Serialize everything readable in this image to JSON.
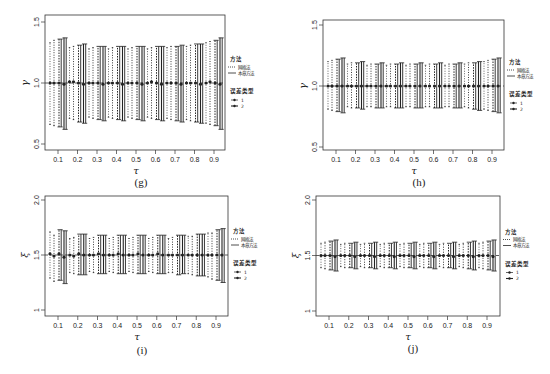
{
  "figure": {
    "legend": {
      "method_title": "方法",
      "methods": [
        {
          "label": "网格法",
          "style": "dotted"
        },
        {
          "label": "本章方法",
          "style": "solid"
        }
      ],
      "error_type_title": "误差类型",
      "error_types": [
        {
          "label": "1"
        },
        {
          "label": "2"
        }
      ]
    },
    "colors": {
      "ink": "#222222",
      "axis": "#333333",
      "reference_line": "#333333"
    }
  },
  "chart_data": [
    {
      "panel": "(g)",
      "type": "errorbar",
      "title": "",
      "xlabel": "τ",
      "ylabel": "γ",
      "ylim": [
        0.5,
        1.5
      ],
      "yticks": [
        "0.5",
        "1.0",
        "1.5"
      ],
      "categories": [
        "0.1",
        "0.2",
        "0.3",
        "0.4",
        "0.5",
        "0.6",
        "0.7",
        "0.8",
        "0.9"
      ],
      "reference_line": 1.0,
      "grid": false,
      "legend_position": "right",
      "series": [
        {
          "name": "网格法 / 误差类型1",
          "center": [
            1.0,
            1.01,
            1.0,
            1.0,
            1.0,
            1.0,
            1.0,
            1.0,
            1.0
          ],
          "lower": [
            0.66,
            0.71,
            0.72,
            0.72,
            0.72,
            0.72,
            0.71,
            0.7,
            0.67
          ],
          "upper": [
            1.33,
            1.29,
            1.28,
            1.28,
            1.28,
            1.28,
            1.29,
            1.3,
            1.33
          ]
        },
        {
          "name": "网格法 / 误差类型2",
          "center": [
            1.0,
            1.01,
            1.0,
            1.0,
            1.0,
            1.01,
            1.0,
            1.0,
            1.01
          ],
          "lower": [
            0.65,
            0.7,
            0.71,
            0.71,
            0.71,
            0.71,
            0.7,
            0.69,
            0.66
          ],
          "upper": [
            1.35,
            1.3,
            1.29,
            1.29,
            1.29,
            1.29,
            1.3,
            1.31,
            1.34
          ]
        },
        {
          "name": "本章方法 / 误差类型1",
          "center": [
            1.0,
            1.0,
            1.0,
            1.0,
            1.0,
            1.0,
            1.0,
            1.0,
            1.0
          ],
          "lower": [
            0.64,
            0.68,
            0.7,
            0.7,
            0.7,
            0.7,
            0.69,
            0.68,
            0.65
          ],
          "upper": [
            1.36,
            1.31,
            1.3,
            1.3,
            1.3,
            1.3,
            1.3,
            1.32,
            1.35
          ]
        },
        {
          "name": "本章方法 / 误差类型2",
          "center": [
            0.99,
            0.99,
            0.99,
            0.99,
            0.99,
            0.99,
            0.99,
            0.99,
            0.99
          ],
          "lower": [
            0.62,
            0.67,
            0.69,
            0.69,
            0.69,
            0.69,
            0.68,
            0.67,
            0.62
          ],
          "upper": [
            1.37,
            1.32,
            1.3,
            1.3,
            1.3,
            1.3,
            1.31,
            1.32,
            1.37
          ]
        }
      ]
    },
    {
      "panel": "(h)",
      "type": "errorbar",
      "title": "",
      "xlabel": "τ",
      "ylabel": "γ",
      "ylim": [
        0.5,
        1.5
      ],
      "yticks": [
        "0.5",
        "1.0",
        "1.5"
      ],
      "categories": [
        "0.1",
        "0.2",
        "0.3",
        "0.4",
        "0.5",
        "0.6",
        "0.7",
        "0.8",
        "0.9"
      ],
      "reference_line": 1.0,
      "grid": false,
      "legend_position": "right",
      "series": [
        {
          "name": "网格法 / 误差类型1",
          "center": [
            1.0,
            1.0,
            1.0,
            1.0,
            1.0,
            1.0,
            1.0,
            1.0,
            1.0
          ],
          "lower": [
            0.81,
            0.83,
            0.83,
            0.83,
            0.83,
            0.83,
            0.83,
            0.83,
            0.81
          ],
          "upper": [
            1.2,
            1.18,
            1.17,
            1.17,
            1.17,
            1.17,
            1.17,
            1.18,
            1.2
          ]
        },
        {
          "name": "网格法 / 误差类型2",
          "center": [
            1.0,
            1.0,
            1.0,
            1.0,
            1.0,
            1.0,
            1.0,
            1.0,
            1.0
          ],
          "lower": [
            0.8,
            0.82,
            0.83,
            0.83,
            0.83,
            0.83,
            0.83,
            0.82,
            0.8
          ],
          "upper": [
            1.21,
            1.19,
            1.18,
            1.18,
            1.18,
            1.18,
            1.18,
            1.19,
            1.21
          ]
        },
        {
          "name": "本章方法 / 误差类型1",
          "center": [
            1.0,
            1.0,
            1.0,
            1.0,
            1.0,
            1.0,
            1.0,
            1.0,
            1.0
          ],
          "lower": [
            0.79,
            0.82,
            0.82,
            0.82,
            0.82,
            0.82,
            0.82,
            0.81,
            0.79
          ],
          "upper": [
            1.22,
            1.19,
            1.18,
            1.18,
            1.18,
            1.18,
            1.18,
            1.19,
            1.22
          ]
        },
        {
          "name": "本章方法 / 误差类型2",
          "center": [
            1.0,
            1.0,
            1.0,
            1.0,
            1.0,
            1.0,
            1.0,
            1.0,
            1.0
          ],
          "lower": [
            0.78,
            0.81,
            0.82,
            0.82,
            0.82,
            0.82,
            0.82,
            0.8,
            0.78
          ],
          "upper": [
            1.23,
            1.2,
            1.19,
            1.19,
            1.19,
            1.19,
            1.19,
            1.2,
            1.23
          ]
        }
      ]
    },
    {
      "panel": "(i)",
      "type": "errorbar",
      "title": "",
      "xlabel": "τ",
      "ylabel": "ξ",
      "ylim": [
        1.0,
        2.0
      ],
      "yticks": [
        "1",
        "1.5",
        "2.0"
      ],
      "categories": [
        "0.1",
        "0.2",
        "0.3",
        "0.4",
        "0.5",
        "0.6",
        "0.7",
        "0.8",
        "0.9"
      ],
      "reference_line": 1.5,
      "grid": false,
      "legend_position": "right",
      "series": [
        {
          "name": "网格法 / 误差类型1",
          "center": [
            1.51,
            1.5,
            1.5,
            1.5,
            1.5,
            1.5,
            1.5,
            1.5,
            1.5
          ],
          "lower": [
            1.29,
            1.34,
            1.35,
            1.35,
            1.35,
            1.35,
            1.34,
            1.33,
            1.3
          ],
          "upper": [
            1.71,
            1.65,
            1.65,
            1.65,
            1.65,
            1.65,
            1.65,
            1.67,
            1.7
          ]
        },
        {
          "name": "网格法 / 误差类型2",
          "center": [
            1.49,
            1.49,
            1.5,
            1.5,
            1.5,
            1.5,
            1.5,
            1.5,
            1.5
          ],
          "lower": [
            1.26,
            1.33,
            1.34,
            1.34,
            1.34,
            1.34,
            1.34,
            1.32,
            1.28
          ],
          "upper": [
            1.68,
            1.66,
            1.66,
            1.66,
            1.66,
            1.66,
            1.66,
            1.67,
            1.7
          ]
        },
        {
          "name": "本章方法 / 误差类型1",
          "center": [
            1.51,
            1.51,
            1.51,
            1.51,
            1.51,
            1.51,
            1.5,
            1.5,
            1.5
          ],
          "lower": [
            1.27,
            1.32,
            1.33,
            1.33,
            1.33,
            1.33,
            1.32,
            1.31,
            1.27
          ],
          "upper": [
            1.73,
            1.69,
            1.68,
            1.68,
            1.68,
            1.68,
            1.68,
            1.69,
            1.73
          ]
        },
        {
          "name": "本章方法 / 误差类型2",
          "center": [
            1.48,
            1.5,
            1.5,
            1.5,
            1.5,
            1.5,
            1.5,
            1.5,
            1.5
          ],
          "lower": [
            1.24,
            1.32,
            1.33,
            1.33,
            1.33,
            1.33,
            1.33,
            1.31,
            1.25
          ],
          "upper": [
            1.72,
            1.69,
            1.68,
            1.68,
            1.68,
            1.68,
            1.68,
            1.69,
            1.74
          ]
        }
      ]
    },
    {
      "panel": "(j)",
      "type": "errorbar",
      "title": "",
      "xlabel": "τ",
      "ylabel": "ξ",
      "ylim": [
        1.0,
        2.0
      ],
      "yticks": [
        "1",
        "1.5",
        "2.0"
      ],
      "categories": [
        "0.1",
        "0.2",
        "0.3",
        "0.4",
        "0.5",
        "0.6",
        "0.7",
        "0.8",
        "0.9"
      ],
      "reference_line": 1.5,
      "grid": false,
      "legend_position": "right",
      "series": [
        {
          "name": "网格法 / 误差类型1",
          "center": [
            1.5,
            1.5,
            1.5,
            1.5,
            1.5,
            1.5,
            1.5,
            1.5,
            1.5
          ],
          "lower": [
            1.39,
            1.4,
            1.4,
            1.4,
            1.4,
            1.4,
            1.4,
            1.4,
            1.39
          ],
          "upper": [
            1.61,
            1.6,
            1.6,
            1.6,
            1.6,
            1.6,
            1.6,
            1.6,
            1.61
          ]
        },
        {
          "name": "网格法 / 误差类型2",
          "center": [
            1.5,
            1.5,
            1.5,
            1.5,
            1.5,
            1.5,
            1.5,
            1.5,
            1.5
          ],
          "lower": [
            1.38,
            1.39,
            1.39,
            1.39,
            1.39,
            1.39,
            1.39,
            1.39,
            1.38
          ],
          "upper": [
            1.62,
            1.61,
            1.61,
            1.61,
            1.61,
            1.61,
            1.61,
            1.61,
            1.62
          ]
        },
        {
          "name": "本章方法 / 误差类型1",
          "center": [
            1.5,
            1.5,
            1.5,
            1.5,
            1.5,
            1.5,
            1.5,
            1.5,
            1.5
          ],
          "lower": [
            1.37,
            1.39,
            1.39,
            1.39,
            1.39,
            1.39,
            1.39,
            1.38,
            1.37
          ],
          "upper": [
            1.63,
            1.61,
            1.61,
            1.61,
            1.61,
            1.61,
            1.61,
            1.62,
            1.63
          ]
        },
        {
          "name": "本章方法 / 误差类型2",
          "center": [
            1.49,
            1.49,
            1.49,
            1.49,
            1.49,
            1.49,
            1.49,
            1.49,
            1.49
          ],
          "lower": [
            1.36,
            1.38,
            1.38,
            1.38,
            1.38,
            1.38,
            1.38,
            1.37,
            1.36
          ],
          "upper": [
            1.64,
            1.62,
            1.62,
            1.62,
            1.62,
            1.62,
            1.62,
            1.63,
            1.64
          ]
        }
      ]
    }
  ],
  "panels": [
    {
      "id": "g",
      "caption": "(g)",
      "ylabel": "γ",
      "xlabel": "τ"
    },
    {
      "id": "h",
      "caption": "(h)",
      "ylabel": "γ",
      "xlabel": "τ"
    },
    {
      "id": "i",
      "caption": "(i)",
      "ylabel": "ξ",
      "xlabel": "τ"
    },
    {
      "id": "j",
      "caption": "(j)",
      "ylabel": "ξ",
      "xlabel": "τ"
    }
  ]
}
